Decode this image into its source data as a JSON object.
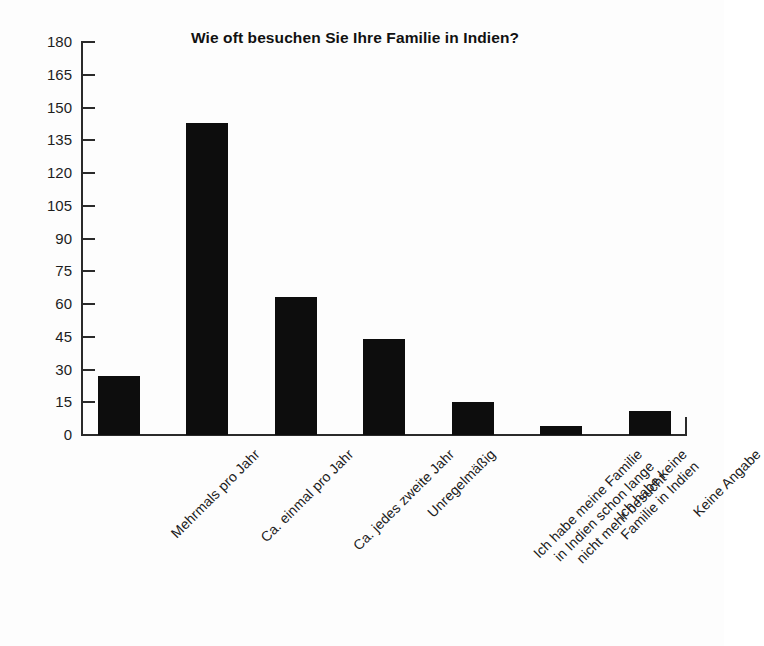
{
  "chart_data": {
    "type": "bar",
    "title": "Wie oft besuchen Sie Ihre Familie in Indien?",
    "xlabel": "",
    "ylabel": "",
    "ylim": [
      0,
      180
    ],
    "ytick_step": 15,
    "yticks": [
      0,
      15,
      30,
      45,
      60,
      75,
      90,
      105,
      120,
      135,
      150,
      165,
      180
    ],
    "categories": [
      "Mehrmals pro Jahr",
      "Ca. einmal pro Jahr",
      "Ca. jedes zweite Jahr",
      "Unregelmäßig",
      "Ich habe meine Familie\nin Indien schon lange\nnicht mehr besucht",
      "Ich habe keine\nFamilie in Indien",
      "Keine Angabe"
    ],
    "values": [
      27,
      143,
      63,
      44,
      15,
      4,
      11
    ],
    "bar_color": "#0d0d0d",
    "background_color": "#fdfdfd",
    "axis_color": "#2a2a2a",
    "grid": false,
    "legend": null,
    "xtick_rotation": -45
  }
}
